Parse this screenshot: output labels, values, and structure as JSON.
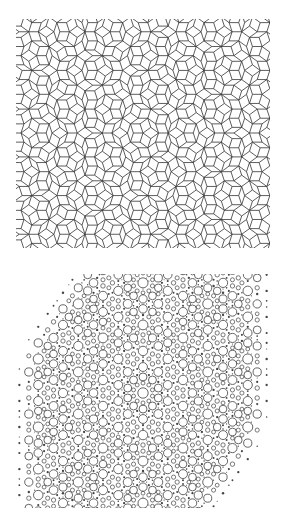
{
  "figure": {
    "panels": [
      {
        "id": "penrose-tiling",
        "description": "Penrose rhombus tiling (thick and thin rhombi), black outlines on white",
        "stroke_color": "#333333",
        "background": "#ffffff",
        "clip": {
          "x": 16,
          "y": 19,
          "width": 254,
          "height": 229
        },
        "center": {
          "x": 143,
          "y": 133
        },
        "edge_length": 9.6
      },
      {
        "id": "diffraction-pattern",
        "description": "Ten-fold symmetric diffraction pattern: open rings of varying size and small filled dots",
        "ring_color": "#555555",
        "dot_color": "#444444",
        "background": "#ffffff",
        "clip": {
          "x": 14,
          "y": 274,
          "width": 258,
          "height": 234
        },
        "center": {
          "x": 143,
          "y": 393
        },
        "scale": 26
      }
    ]
  }
}
